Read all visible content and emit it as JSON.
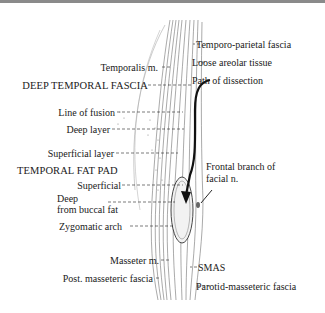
{
  "figure": {
    "labels_left": {
      "temporalis": "Temporalis m.",
      "deep_temporal_fascia": "DEEP TEMPORAL FASCIA",
      "line_of_fusion": "Line of fusion",
      "deep_layer": "Deep layer",
      "superficial_layer": "Superficial layer",
      "temporal_fat_pad": "TEMPORAL FAT PAD",
      "superficial": "Superficial",
      "deep": "Deep",
      "from_buccal_fat": "from buccal fat",
      "zygomatic_arch": "Zygomatic arch",
      "masseter": "Masseter m.",
      "post_masseteric_fascia": "Post. masseteric fascia"
    },
    "labels_right": {
      "temporo_parietal_fascia": "Temporo-parietal fascia",
      "loose_areolar_tissue": "Loose areolar tissue",
      "path_of_dissection": "Path of dissection",
      "frontal_branch_1": "Frontal branch of",
      "frontal_branch_2": "facial n.",
      "smas": "SMAS",
      "parotid_masseteric_fascia": "Parotid-masseteric fascia"
    },
    "colors": {
      "ink": "#1a1a1a",
      "top_bar": "#8a8a8a",
      "background": "#ffffff"
    }
  }
}
